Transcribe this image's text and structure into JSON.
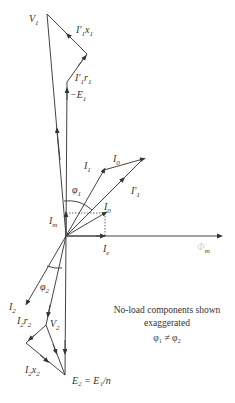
{
  "diagram": {
    "type": "phasor-diagram",
    "labels": {
      "V1": {
        "main": "V",
        "sub": "1"
      },
      "I1x1": {
        "main": "I′",
        "sub": "1",
        "tail": "x",
        "tailsub": "1"
      },
      "I1r1": {
        "main": "I′",
        "sub": "1",
        "tail": "r",
        "tailsub": "1"
      },
      "negE1": {
        "main": "−E",
        "sub": "1"
      },
      "I1": {
        "main": "I",
        "sub": "1"
      },
      "I0_top": {
        "main": "I",
        "sub": "0"
      },
      "Iprime1": {
        "main": "I′",
        "sub": "1"
      },
      "phi1": {
        "main": "φ",
        "sub": "1"
      },
      "I0_inner": {
        "main": "I",
        "sub": "0"
      },
      "Im": {
        "main": "I",
        "sub": "m"
      },
      "Ie": {
        "main": "I",
        "sub": "e"
      },
      "phim": {
        "main": "Φ",
        "sub": "m"
      },
      "I2": {
        "main": "I",
        "sub": "2"
      },
      "phi2": {
        "main": "φ",
        "sub": "2"
      },
      "I2r2": {
        "main": "I",
        "sub": "2",
        "tail": "r",
        "tailsub": "2"
      },
      "V2": {
        "main": "V",
        "sub": "2"
      },
      "I2x2": {
        "main": "I",
        "sub": "2",
        "tail": "x",
        "tailsub": "2"
      },
      "E2": {
        "text": "E₂ = E₁/n"
      }
    },
    "note": {
      "line1": "No-load components shown",
      "line2": "exaggerated",
      "line3": "φ₁ ≠ φ₂"
    },
    "points": {
      "origin": [
        66,
        236
      ],
      "V1": [
        47,
        14
      ],
      "negE1": [
        67,
        82
      ],
      "x1_corner": [
        87,
        54
      ],
      "I1": [
        104,
        170
      ],
      "Iprime1": [
        143,
        159
      ],
      "I0_inner": [
        105,
        213
      ],
      "Im": [
        66,
        213
      ],
      "Ie": [
        105,
        236
      ],
      "phim_end": [
        221,
        236
      ],
      "I2": [
        27,
        303
      ],
      "V2": [
        46,
        325
      ],
      "x2_corner": [
        26,
        343
      ],
      "E2": [
        65,
        375
      ]
    }
  }
}
